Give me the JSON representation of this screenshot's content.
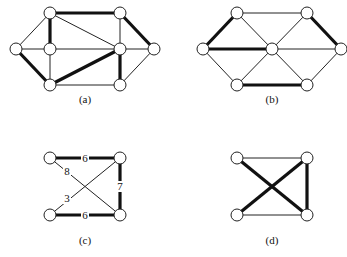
{
  "figure": {
    "panels": [
      {
        "id": "a",
        "caption": "(a)",
        "caption_pos": [
          85,
          103
        ],
        "nodes": [
          [
            50,
            13
          ],
          [
            120,
            13
          ],
          [
            16,
            49
          ],
          [
            50,
            49
          ],
          [
            120,
            49
          ],
          [
            154,
            49
          ],
          [
            50,
            85
          ],
          [
            120,
            85
          ]
        ],
        "edges": [
          {
            "from": 0,
            "to": 1,
            "thick": true
          },
          {
            "from": 0,
            "to": 2,
            "thick": false
          },
          {
            "from": 0,
            "to": 3,
            "thick": true
          },
          {
            "from": 0,
            "to": 4,
            "thick": false
          },
          {
            "from": 1,
            "to": 4,
            "thick": false
          },
          {
            "from": 1,
            "to": 5,
            "thick": true
          },
          {
            "from": 2,
            "to": 3,
            "thick": false
          },
          {
            "from": 2,
            "to": 6,
            "thick": true
          },
          {
            "from": 3,
            "to": 4,
            "thick": false
          },
          {
            "from": 3,
            "to": 6,
            "thick": false
          },
          {
            "from": 4,
            "to": 5,
            "thick": false
          },
          {
            "from": 4,
            "to": 6,
            "thick": true
          },
          {
            "from": 4,
            "to": 7,
            "thick": true
          },
          {
            "from": 5,
            "to": 7,
            "thick": false
          },
          {
            "from": 6,
            "to": 7,
            "thick": false
          }
        ]
      },
      {
        "id": "b",
        "caption": "(b)",
        "caption_pos": [
          272,
          103
        ],
        "nodes": [
          [
            237,
            13
          ],
          [
            307,
            13
          ],
          [
            203,
            49
          ],
          [
            272,
            49
          ],
          [
            341,
            49
          ],
          [
            237,
            85
          ],
          [
            307,
            85
          ]
        ],
        "edges": [
          {
            "from": 0,
            "to": 1,
            "thick": false
          },
          {
            "from": 0,
            "to": 2,
            "thick": true
          },
          {
            "from": 0,
            "to": 3,
            "thick": false
          },
          {
            "from": 1,
            "to": 3,
            "thick": false
          },
          {
            "from": 1,
            "to": 4,
            "thick": true
          },
          {
            "from": 2,
            "to": 3,
            "thick": true
          },
          {
            "from": 2,
            "to": 5,
            "thick": false
          },
          {
            "from": 3,
            "to": 4,
            "thick": false
          },
          {
            "from": 3,
            "to": 5,
            "thick": false
          },
          {
            "from": 3,
            "to": 6,
            "thick": false
          },
          {
            "from": 4,
            "to": 6,
            "thick": false
          },
          {
            "from": 5,
            "to": 6,
            "thick": true
          }
        ]
      },
      {
        "id": "c",
        "caption": "(c)",
        "caption_pos": [
          85,
          244
        ],
        "nodes": [
          [
            50,
            158
          ],
          [
            120,
            158
          ],
          [
            50,
            215
          ],
          [
            120,
            215
          ]
        ],
        "edges": [
          {
            "from": 0,
            "to": 1,
            "thick": true,
            "weight": "6",
            "label_pos": [
              85,
              162
            ]
          },
          {
            "from": 0,
            "to": 3,
            "thick": false,
            "weight": "8",
            "label_pos": [
              67,
              175
            ]
          },
          {
            "from": 1,
            "to": 2,
            "thick": false,
            "weight": "3",
            "label_pos": [
              67,
              202
            ]
          },
          {
            "from": 1,
            "to": 3,
            "thick": true,
            "weight": "7",
            "label_pos": [
              120,
              190
            ]
          },
          {
            "from": 2,
            "to": 3,
            "thick": true,
            "weight": "6",
            "label_pos": [
              85,
              219
            ]
          }
        ]
      },
      {
        "id": "d",
        "caption": "(d)",
        "caption_pos": [
          272,
          244
        ],
        "nodes": [
          [
            237,
            158
          ],
          [
            307,
            158
          ],
          [
            237,
            215
          ],
          [
            307,
            215
          ]
        ],
        "edges": [
          {
            "from": 0,
            "to": 1,
            "thick": false
          },
          {
            "from": 0,
            "to": 3,
            "thick": true
          },
          {
            "from": 1,
            "to": 2,
            "thick": true
          },
          {
            "from": 1,
            "to": 3,
            "thick": true
          },
          {
            "from": 2,
            "to": 3,
            "thick": false
          }
        ]
      }
    ],
    "node_radius": 6,
    "colors": {
      "stroke": "#222222",
      "fill": "#ffffff",
      "background": "#ffffff"
    }
  }
}
